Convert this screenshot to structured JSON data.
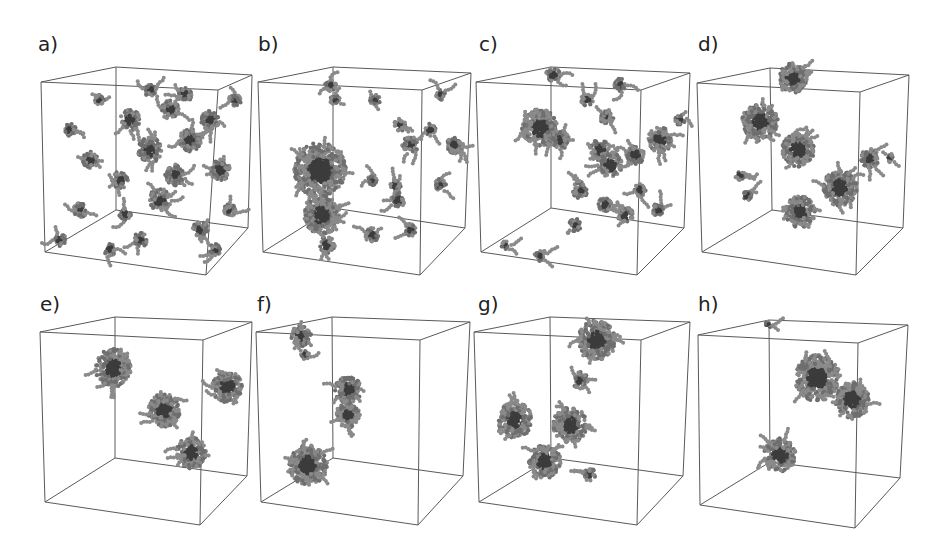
{
  "figure": {
    "panels": [
      {
        "id": "a",
        "label": "a)",
        "label_pos": [
          38,
          48
        ],
        "description": "many small dispersed chain clusters",
        "cube": {
          "ftl": [
            41,
            82
          ],
          "btl": [
            116,
            67
          ],
          "btr": [
            252,
            75
          ],
          "ftr": [
            218,
            90
          ],
          "fbl": [
            45,
            252
          ],
          "fbr": [
            206,
            275
          ],
          "bbl": [
            116,
            210
          ],
          "bbr": [
            248,
            228
          ]
        }
      },
      {
        "id": "b",
        "label": "b)",
        "label_pos": [
          258,
          48
        ],
        "description": "one large elongated cluster plus small fragments",
        "cube": {
          "ftl": [
            258,
            82
          ],
          "btl": [
            333,
            67
          ],
          "btr": [
            471,
            73
          ],
          "ftr": [
            422,
            90
          ],
          "fbl": [
            263,
            252
          ],
          "fbr": [
            420,
            275
          ],
          "bbl": [
            333,
            208
          ],
          "bbr": [
            465,
            228
          ]
        }
      },
      {
        "id": "c",
        "label": "c)",
        "label_pos": [
          480,
          48
        ],
        "description": "several medium clusters and chains",
        "cube": {
          "ftl": [
            476,
            82
          ],
          "btl": [
            551,
            67
          ],
          "btr": [
            690,
            73
          ],
          "ftr": [
            641,
            90
          ],
          "fbl": [
            481,
            252
          ],
          "fbr": [
            637,
            275
          ],
          "bbl": [
            551,
            208
          ],
          "bbr": [
            684,
            228
          ]
        }
      },
      {
        "id": "d",
        "label": "d)",
        "label_pos": [
          698,
          48
        ],
        "description": "four larger clusters",
        "cube": {
          "ftl": [
            697,
            83
          ],
          "btl": [
            770,
            68
          ],
          "btr": [
            909,
            75
          ],
          "ftr": [
            860,
            92
          ],
          "fbl": [
            702,
            252
          ],
          "fbr": [
            856,
            275
          ],
          "bbl": [
            772,
            210
          ],
          "bbr": [
            903,
            228
          ]
        }
      },
      {
        "id": "e",
        "label": "e)",
        "label_pos": [
          40,
          312
        ],
        "description": "four compact globular clusters",
        "cube": {
          "ftl": [
            40,
            332
          ],
          "btl": [
            115,
            317
          ],
          "btr": [
            252,
            322
          ],
          "ftr": [
            203,
            340
          ],
          "fbl": [
            45,
            502
          ],
          "fbr": [
            200,
            525
          ],
          "bbl": [
            115,
            458
          ],
          "bbr": [
            247,
            476
          ]
        }
      },
      {
        "id": "f",
        "label": "f)",
        "label_pos": [
          257,
          312
        ],
        "description": "three compact clusters",
        "cube": {
          "ftl": [
            256,
            332
          ],
          "btl": [
            332,
            317
          ],
          "btr": [
            470,
            322
          ],
          "ftr": [
            420,
            340
          ],
          "fbl": [
            261,
            502
          ],
          "fbr": [
            418,
            525
          ],
          "bbl": [
            333,
            458
          ],
          "bbr": [
            463,
            476
          ]
        }
      },
      {
        "id": "g",
        "label": "g)",
        "label_pos": [
          478,
          312
        ],
        "description": "four clusters with small fragments",
        "cube": {
          "ftl": [
            474,
            332
          ],
          "btl": [
            550,
            317
          ],
          "btr": [
            690,
            322
          ],
          "ftr": [
            641,
            340
          ],
          "fbl": [
            479,
            502
          ],
          "fbr": [
            637,
            525
          ],
          "bbl": [
            551,
            458
          ],
          "bbr": [
            683,
            476
          ]
        }
      },
      {
        "id": "h",
        "label": "h)",
        "label_pos": [
          698,
          312
        ],
        "description": "two large merged clusters",
        "cube": {
          "ftl": [
            698,
            335
          ],
          "btl": [
            769,
            320
          ],
          "btr": [
            908,
            325
          ],
          "ftr": [
            858,
            343
          ],
          "fbl": [
            700,
            505
          ],
          "fbr": [
            855,
            528
          ],
          "bbl": [
            770,
            462
          ],
          "bbr": [
            900,
            478
          ]
        }
      }
    ],
    "colors": {
      "edge": "#5a5a5a",
      "bead_dark": "#3c3c3c",
      "bead_mid": "#6e6e6e",
      "bead_light": "#8a8a8a",
      "label": "#222222"
    },
    "clusters": {
      "a": [
        [
          70,
          130,
          6
        ],
        [
          90,
          160,
          8
        ],
        [
          130,
          120,
          10
        ],
        [
          150,
          150,
          12
        ],
        [
          170,
          110,
          9
        ],
        [
          190,
          140,
          11
        ],
        [
          210,
          120,
          9
        ],
        [
          220,
          170,
          10
        ],
        [
          160,
          200,
          11
        ],
        [
          120,
          180,
          8
        ],
        [
          80,
          210,
          7
        ],
        [
          200,
          230,
          8
        ],
        [
          140,
          240,
          7
        ],
        [
          230,
          210,
          6
        ],
        [
          110,
          250,
          6
        ],
        [
          60,
          240,
          6
        ],
        [
          185,
          95,
          7
        ],
        [
          235,
          100,
          6
        ],
        [
          150,
          90,
          6
        ],
        [
          100,
          100,
          5
        ],
        [
          175,
          175,
          10
        ],
        [
          125,
          215,
          6
        ],
        [
          215,
          250,
          6
        ]
      ],
      "b": [
        [
          320,
          170,
          26
        ],
        [
          322,
          215,
          18
        ],
        [
          327,
          245,
          8
        ],
        [
          330,
          85,
          6
        ],
        [
          335,
          100,
          5
        ],
        [
          375,
          100,
          5
        ],
        [
          400,
          125,
          6
        ],
        [
          410,
          145,
          8
        ],
        [
          430,
          130,
          6
        ],
        [
          455,
          145,
          8
        ],
        [
          395,
          185,
          6
        ],
        [
          398,
          200,
          7
        ],
        [
          440,
          185,
          6
        ],
        [
          372,
          180,
          5
        ],
        [
          372,
          235,
          7
        ],
        [
          410,
          230,
          6
        ],
        [
          440,
          95,
          5
        ]
      ],
      "c": [
        [
          540,
          128,
          18
        ],
        [
          560,
          140,
          9
        ],
        [
          600,
          150,
          10
        ],
        [
          610,
          165,
          12
        ],
        [
          635,
          155,
          9
        ],
        [
          660,
          140,
          12
        ],
        [
          580,
          190,
          8
        ],
        [
          605,
          205,
          7
        ],
        [
          625,
          215,
          8
        ],
        [
          540,
          255,
          6
        ],
        [
          575,
          225,
          6
        ],
        [
          553,
          75,
          7
        ],
        [
          620,
          85,
          6
        ],
        [
          587,
          100,
          6
        ],
        [
          607,
          117,
          7
        ],
        [
          680,
          120,
          5
        ],
        [
          505,
          245,
          4
        ],
        [
          640,
          190,
          6
        ],
        [
          658,
          210,
          6
        ]
      ],
      "d": [
        [
          760,
          122,
          18
        ],
        [
          798,
          150,
          16
        ],
        [
          793,
          78,
          14
        ],
        [
          840,
          188,
          17
        ],
        [
          800,
          212,
          15
        ],
        [
          870,
          158,
          9
        ],
        [
          740,
          175,
          5
        ],
        [
          747,
          195,
          5
        ],
        [
          890,
          158,
          4
        ]
      ],
      "e": [
        [
          113,
          368,
          18
        ],
        [
          164,
          410,
          16
        ],
        [
          227,
          387,
          15
        ],
        [
          191,
          453,
          15
        ]
      ],
      "f": [
        [
          301,
          336,
          10
        ],
        [
          348,
          390,
          13
        ],
        [
          348,
          415,
          12
        ],
        [
          308,
          465,
          19
        ],
        [
          305,
          355,
          4
        ]
      ],
      "g": [
        [
          597,
          340,
          19
        ],
        [
          515,
          420,
          17
        ],
        [
          570,
          425,
          17
        ],
        [
          545,
          462,
          16
        ],
        [
          580,
          380,
          8
        ],
        [
          590,
          475,
          6
        ]
      ],
      "h": [
        [
          817,
          378,
          22
        ],
        [
          852,
          400,
          17
        ],
        [
          780,
          455,
          16
        ],
        [
          768,
          325,
          3
        ]
      ]
    }
  }
}
